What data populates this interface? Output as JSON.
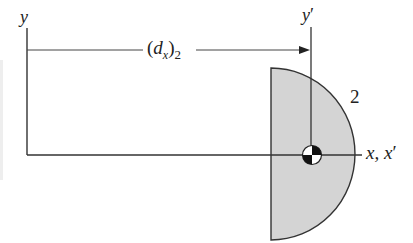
{
  "diagram": {
    "type": "centroid-offset-figure",
    "axes": {
      "y_label": "y",
      "y_prime_label": "y",
      "y_prime_mark": "′",
      "x_label": "x, x",
      "x_prime_mark": "′"
    },
    "dimension": {
      "label_open": "(",
      "label_d": "d",
      "label_sub_x": "x",
      "label_close": ")",
      "label_sub_2": "2"
    },
    "shape": {
      "name": "semicircle",
      "label": "2",
      "fill_color": "#d4d4d4",
      "stroke_color": "#333333"
    },
    "line_color": "#333333",
    "centroid_symbol": "centroid-marker"
  }
}
